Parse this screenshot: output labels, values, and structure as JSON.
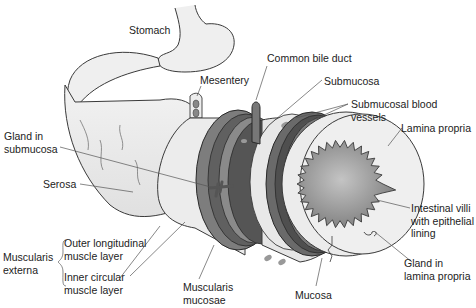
{
  "diagram": {
    "colors": {
      "background": "#ffffff",
      "serosa": "#eaeaea",
      "outer_longitudinal_muscle": "#7d7d7d",
      "inner_circular_muscle": "#5f5f5f",
      "submucosa": "#e6e6e6",
      "lamina_propria": "#ececec",
      "lumen": "#9a9a9a",
      "outline": "#3a3a3a",
      "leader_line": "#555555"
    },
    "labels": {
      "stomach": "Stomach",
      "mesentery": "Mesentery",
      "common_bile_duct": "Common bile duct",
      "submucosa": "Submucosa",
      "submucosal_blood_vessels_1": "Submucosal blood",
      "submucosal_blood_vessels_2": "vessels",
      "lamina_propria": "Lamina propria",
      "gland_in_submucosa_1": "Gland in",
      "gland_in_submucosa_2": "submucosa",
      "serosa": "Serosa",
      "intestinal_villi_1": "Intestinal villi",
      "intestinal_villi_2": "with epithelial",
      "intestinal_villi_3": "lining",
      "gland_in_lamina_propria_1": "Gland in",
      "gland_in_lamina_propria_2": "lamina propria",
      "muscularis_externa_1": "Muscularis",
      "muscularis_externa_2": "externa",
      "outer_longitudinal_1": "Outer longitudinal",
      "outer_longitudinal_2": "muscle layer",
      "inner_circular_1": "Inner circular",
      "inner_circular_2": "muscle layer",
      "muscularis_mucosae_1": "Muscularis",
      "muscularis_mucosae_2": "mucosae",
      "mucosa": "Mucosa"
    }
  }
}
